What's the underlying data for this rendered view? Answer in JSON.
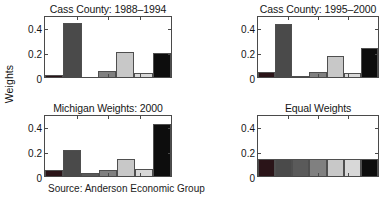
{
  "figure": {
    "ylabel": "Weights",
    "caption": "Source: Anderson Economic Group",
    "axis_color": "#4a4a4a",
    "background": "#ffffff"
  },
  "chart_data": [
    {
      "type": "bar",
      "title": "Cass County: 1988–1994",
      "panel": "top-left",
      "xlabel": "",
      "ylabel": "Weights",
      "ylim": [
        0,
        0.5
      ],
      "yticks": [
        0,
        0.2,
        0.4
      ],
      "ytick_labels": [
        "0",
        "0.2",
        "0.4"
      ],
      "grid": false,
      "categories": [
        "1",
        "2",
        "3",
        "4",
        "5",
        "6",
        "7"
      ],
      "values": [
        0.02,
        0.45,
        0.0,
        0.05,
        0.21,
        0.03,
        0.2
      ],
      "colors": [
        "#2a1418",
        "#4a4a4a",
        "#5a5a5a",
        "#808080",
        "#c8c8c8",
        "#d8d8d8",
        "#0d0d0d"
      ]
    },
    {
      "type": "bar",
      "title": "Cass County: 1995–2000",
      "panel": "top-right",
      "xlabel": "",
      "ylabel": "",
      "ylim": [
        0,
        0.5
      ],
      "yticks": [
        0,
        0.2,
        0.4
      ],
      "ytick_labels": [
        "0",
        "0.2",
        "0.4"
      ],
      "grid": false,
      "categories": [
        "1",
        "2",
        "3",
        "4",
        "5",
        "6",
        "7"
      ],
      "values": [
        0.04,
        0.44,
        0.01,
        0.045,
        0.175,
        0.03,
        0.24
      ],
      "colors": [
        "#2a1418",
        "#4a4a4a",
        "#5a5a5a",
        "#808080",
        "#c8c8c8",
        "#d8d8d8",
        "#0d0d0d"
      ]
    },
    {
      "type": "bar",
      "title": "Michigan Weights: 2000",
      "panel": "bottom-left",
      "xlabel": "",
      "ylabel": "Weights",
      "ylim": [
        0,
        0.5
      ],
      "yticks": [
        0,
        0.2,
        0.4
      ],
      "ytick_labels": [
        "0",
        "0.2",
        "0.4"
      ],
      "grid": false,
      "categories": [
        "1",
        "2",
        "3",
        "4",
        "5",
        "6",
        "7"
      ],
      "values": [
        0.05,
        0.215,
        0.025,
        0.05,
        0.145,
        0.055,
        0.435
      ],
      "colors": [
        "#2a1418",
        "#4a4a4a",
        "#5a5a5a",
        "#808080",
        "#c8c8c8",
        "#d8d8d8",
        "#0d0d0d"
      ]
    },
    {
      "type": "bar",
      "title": "Equal Weights",
      "panel": "bottom-right",
      "xlabel": "",
      "ylabel": "",
      "ylim": [
        0,
        0.5
      ],
      "yticks": [
        0,
        0.2,
        0.4
      ],
      "ytick_labels": [
        "0",
        "0.2",
        "0.4"
      ],
      "grid": false,
      "categories": [
        "1",
        "2",
        "3",
        "4",
        "5",
        "6",
        "7"
      ],
      "values": [
        0.143,
        0.143,
        0.143,
        0.143,
        0.143,
        0.143,
        0.143
      ],
      "colors": [
        "#2a1418",
        "#4a4a4a",
        "#5a5a5a",
        "#808080",
        "#c8c8c8",
        "#d8d8d8",
        "#0d0d0d"
      ]
    }
  ]
}
